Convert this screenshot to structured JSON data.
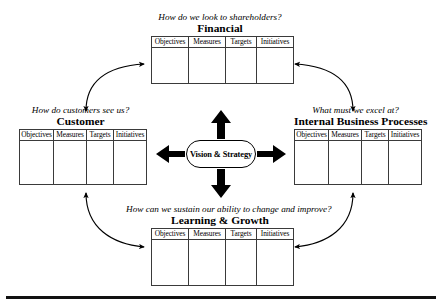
{
  "diagram": {
    "center": {
      "label": "Vision & Strategy",
      "shape": "stadium"
    },
    "column_headers": [
      "Objectives",
      "Measures",
      "Targets",
      "Initiatives"
    ],
    "perspectives": [
      {
        "id": "financial",
        "position": "top",
        "question": "How do we look to shareholders?",
        "title": "Financial",
        "columns": [
          "Objectives",
          "Measures",
          "Targets",
          "Initiatives"
        ],
        "rows": [
          [
            "",
            "",
            "",
            ""
          ]
        ]
      },
      {
        "id": "customer",
        "position": "left",
        "question": "How do customers see us?",
        "title": "Customer",
        "columns": [
          "Objectives",
          "Measures",
          "Targets",
          "Initiatives"
        ],
        "rows": [
          [
            "",
            "",
            "",
            ""
          ]
        ]
      },
      {
        "id": "internal-business-processes",
        "position": "right",
        "question": "What must we excel at?",
        "title": "Internal Business Processes",
        "columns": [
          "Objectives",
          "Measures",
          "Targets",
          "Initiatives"
        ],
        "rows": [
          [
            "",
            "",
            "",
            ""
          ]
        ]
      },
      {
        "id": "learning-and-growth",
        "position": "bottom",
        "question": "How can we sustain our ability to change and improve?",
        "title": "Learning & Growth",
        "columns": [
          "Objectives",
          "Measures",
          "Targets",
          "Initiatives"
        ],
        "rows": [
          [
            "",
            "",
            "",
            ""
          ]
        ]
      }
    ],
    "connectors": {
      "radial_arrows": [
        {
          "name": "vision-to-financial",
          "direction": "up"
        },
        {
          "name": "vision-to-customer",
          "direction": "left"
        },
        {
          "name": "vision-to-internal",
          "direction": "right"
        },
        {
          "name": "vision-to-learning",
          "direction": "down"
        }
      ],
      "curved_arrows": [
        {
          "name": "customer-financial-link",
          "double_headed": true
        },
        {
          "name": "financial-internal-link",
          "double_headed": true
        },
        {
          "name": "customer-learning-link",
          "double_headed": true
        },
        {
          "name": "internal-learning-link",
          "double_headed": true
        }
      ]
    },
    "colors": {
      "ink": "#000000",
      "table_border": "#3a3a3a",
      "rule": "#111111",
      "background": "#ffffff"
    }
  }
}
